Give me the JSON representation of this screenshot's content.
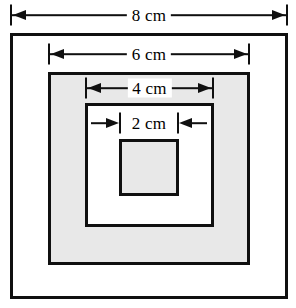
{
  "figure": {
    "type": "geometry-diagram",
    "unit": "cm",
    "colors": {
      "stroke": "#101010",
      "shaded_fill": "#e8e8e8",
      "unshaded_fill": "#ffffff",
      "background": "#ffffff"
    },
    "squares": [
      {
        "id": "outer",
        "label": "8 cm",
        "side_cm": 8,
        "fill": "unshaded"
      },
      {
        "id": "second",
        "label": "6 cm",
        "side_cm": 6,
        "fill": "shaded"
      },
      {
        "id": "third",
        "label": "4 cm",
        "side_cm": 4,
        "fill": "unshaded"
      },
      {
        "id": "inner",
        "label": "2 cm",
        "side_cm": 2,
        "fill": "shaded"
      }
    ],
    "dimensions": {
      "outer": {
        "label": "8 cm",
        "value": 8,
        "arrow_style": "inward"
      },
      "second": {
        "label": "6 cm",
        "value": 6,
        "arrow_style": "inward"
      },
      "third": {
        "label": "4 cm",
        "value": 4,
        "arrow_style": "inward"
      },
      "inner": {
        "label": "2 cm",
        "value": 2,
        "arrow_style": "outward"
      }
    }
  },
  "chart_data": {
    "type": "table",
    "categories": [
      "8 cm",
      "6 cm",
      "4 cm",
      "2 cm"
    ],
    "values": [
      8,
      6,
      4,
      2
    ],
    "xlabel": "square",
    "ylabel": "side length (cm)"
  }
}
